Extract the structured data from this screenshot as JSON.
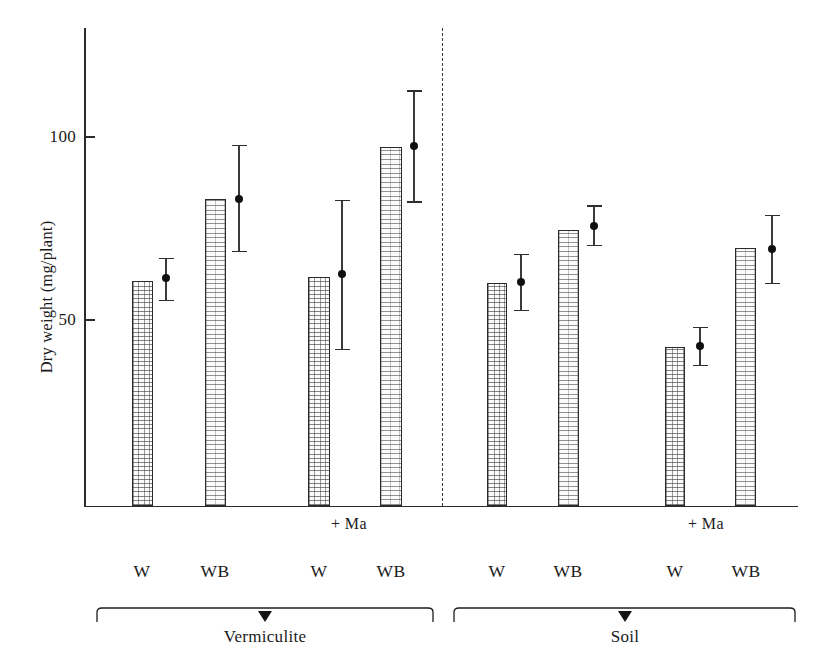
{
  "chart_data": {
    "type": "bar",
    "title": "",
    "xlabel": "",
    "ylabel": "Dry weight (mg/plant)",
    "ylim": [
      0,
      131
    ],
    "grid": false,
    "legend": "none",
    "y_ticks": [
      {
        "value": 50,
        "label": "50"
      },
      {
        "value": 100,
        "label": "100"
      }
    ],
    "categories": [
      "W",
      "WB",
      "W",
      "WB",
      "W",
      "WB",
      "W",
      "WB"
    ],
    "panels": [
      "Vermiculite",
      "Vermiculite",
      "Vermiculite",
      "Vermiculite",
      "Soil",
      "Soil",
      "Soil",
      "Soil"
    ],
    "treatment": [
      "",
      "",
      "+ Ma",
      "+ Ma",
      "",
      "",
      "+ Ma",
      "+ Ma"
    ],
    "values": [
      61.5,
      84.0,
      62.5,
      98.0,
      61.0,
      75.5,
      43.5,
      70.5
    ],
    "series": [
      {
        "name": "Dry weight (bar)",
        "values": [
          61.5,
          84.0,
          62.5,
          98.0,
          61.0,
          75.5,
          43.5,
          70.5
        ]
      },
      {
        "name": "Mean with error bar",
        "values": [
          62.3,
          83.9,
          63.4,
          98.3,
          61.2,
          76.5,
          43.7,
          70.2
        ],
        "error_low": [
          56.3,
          69.7,
          42.9,
          83.3,
          53.6,
          71.3,
          38.5,
          60.9
        ],
        "error_high": [
          67.8,
          98.7,
          83.6,
          113.6,
          68.9,
          82.2,
          48.9,
          79.5
        ]
      }
    ],
    "bar_fill_patterns": [
      "cross-hatch",
      "horizontal-hatch",
      "cross-hatch",
      "horizontal-hatch",
      "cross-hatch",
      "horizontal-hatch",
      "cross-hatch",
      "horizontal-hatch"
    ],
    "annotations": [
      {
        "text": "+ Ma",
        "panel": "Vermiculite"
      },
      {
        "text": "+ Ma",
        "panel": "Soil"
      }
    ],
    "panel_labels": [
      "Vermiculite",
      "Soil"
    ],
    "divider": "dashed vertical line between Vermiculite and Soil panels",
    "colors": {
      "axis": "#2b2b2b",
      "bar_outline": "#2a2a2a",
      "bar_fill": "#fbfbfb",
      "marker": "#101010",
      "error_bar": "#3a3a3a",
      "background": "#ffffff"
    }
  },
  "axis": {
    "y_title": "Dry weight (mg/plant)",
    "tick_100": "100",
    "tick_50": "50"
  },
  "labels": {
    "ma_left": "+ Ma",
    "ma_right": "+ Ma",
    "groups": [
      "W",
      "WB",
      "W",
      "WB",
      "W",
      "WB",
      "W",
      "WB"
    ],
    "panel_left": "Vermiculite",
    "panel_right": "Soil"
  }
}
